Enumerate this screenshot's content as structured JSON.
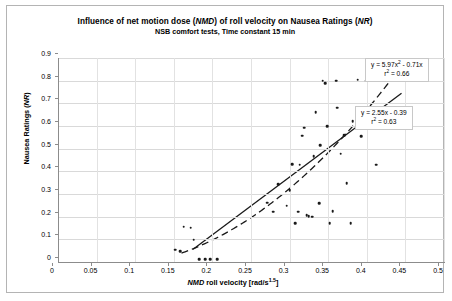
{
  "chart_data": {
    "type": "scatter",
    "title": "Influence of net motion dose (NMD) of roll velocity on Nausea Ratings (NR)",
    "subtitle": "NSB  comfort tests, Time constant 15 min",
    "xlabel": "NMD roll velocity [rad/s",
    "xlabel_exponent": "1.5",
    "xlabel_suffix": "]",
    "ylabel": "Nausea Ratings (NR)",
    "xlim": [
      0,
      0.5
    ],
    "ylim": [
      0,
      0.9
    ],
    "xticks": [
      "0",
      "0.05",
      "0.1",
      "0.15",
      "0.2",
      "0.25",
      "0.3",
      "0.35",
      "0.4",
      "0.45",
      "0.5"
    ],
    "xtick_values": [
      0,
      0.05,
      0.1,
      0.15,
      0.2,
      0.25,
      0.3,
      0.35,
      0.4,
      0.45,
      0.5
    ],
    "yticks": [
      "0",
      "0.1",
      "0.2",
      "0.3",
      "0.4",
      "0.5",
      "0.6",
      "0.7",
      "0.8",
      "0.9"
    ],
    "ytick_values": [
      0,
      0.1,
      0.2,
      0.3,
      0.4,
      0.5,
      0.6,
      0.7,
      0.8,
      0.9
    ],
    "grid": true,
    "grid_axis": "both",
    "legend": "none",
    "marker_color": "#1a1a1a",
    "marker_shape": "diamond",
    "points": [
      [
        0.152,
        0.055
      ],
      [
        0.158,
        0.048
      ],
      [
        0.163,
        0.155
      ],
      [
        0.172,
        0.152
      ],
      [
        0.176,
        0.098
      ],
      [
        0.183,
        0.012
      ],
      [
        0.191,
        0.012
      ],
      [
        0.197,
        0.012
      ],
      [
        0.206,
        0.012
      ],
      [
        0.271,
        0.262
      ],
      [
        0.279,
        0.222
      ],
      [
        0.285,
        0.342
      ],
      [
        0.296,
        0.248
      ],
      [
        0.3,
        0.316
      ],
      [
        0.303,
        0.432
      ],
      [
        0.307,
        0.17
      ],
      [
        0.311,
        0.222
      ],
      [
        0.313,
        0.43
      ],
      [
        0.316,
        0.558
      ],
      [
        0.319,
        0.592
      ],
      [
        0.322,
        0.206
      ],
      [
        0.325,
        0.202
      ],
      [
        0.329,
        0.2
      ],
      [
        0.331,
        0.466
      ],
      [
        0.334,
        0.66
      ],
      [
        0.338,
        0.26
      ],
      [
        0.34,
        0.516
      ],
      [
        0.343,
        0.8
      ],
      [
        0.346,
        0.79
      ],
      [
        0.349,
        0.6
      ],
      [
        0.352,
        0.17
      ],
      [
        0.356,
        0.224
      ],
      [
        0.36,
        0.8
      ],
      [
        0.362,
        0.68
      ],
      [
        0.366,
        0.478
      ],
      [
        0.371,
        0.56
      ],
      [
        0.374,
        0.348
      ],
      [
        0.379,
        0.17
      ],
      [
        0.382,
        0.622
      ],
      [
        0.388,
        0.804
      ],
      [
        0.393,
        0.556
      ],
      [
        0.399,
        0.8
      ],
      [
        0.405,
        0.804
      ],
      [
        0.412,
        0.43
      ],
      [
        0.427,
        0.66
      ],
      [
        0.432,
        0.652
      ]
    ],
    "fits": [
      {
        "name": "quadratic",
        "equation": "y = 5.97x",
        "equation_exponent": "2",
        "equation_tail": " - 0.71x",
        "r2_label": "r",
        "r2_exponent": "2",
        "r2_value": " = 0.66",
        "style": "dashed",
        "coefficients": {
          "a": 5.97,
          "b": -0.71,
          "c": 0
        }
      },
      {
        "name": "linear",
        "equation": "y = 2.55x - 0.39",
        "r2_label": "r",
        "r2_exponent": "2",
        "r2_value": " = 0.63",
        "style": "solid",
        "coefficients": {
          "m": 2.55,
          "b": -0.39
        }
      }
    ]
  }
}
